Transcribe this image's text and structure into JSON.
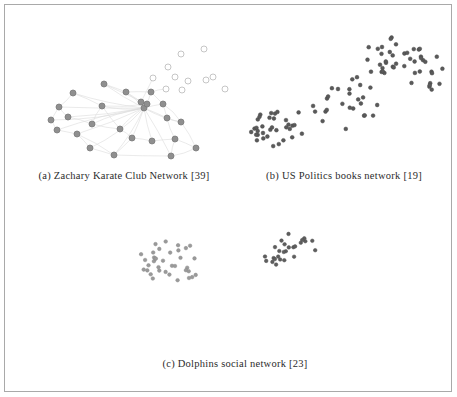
{
  "figure": {
    "border_color": "#a9a9a9",
    "background": "#ffffff"
  },
  "subfigures": [
    {
      "id": "a",
      "caption": "(a) Zachary Karate Club Network [39]",
      "name": "zachary-karate-club-network"
    },
    {
      "id": "b",
      "caption": "(b) US Politics books network [19]",
      "name": "us-politics-books-network"
    },
    {
      "id": "c",
      "caption": "(c) Dolphins social network [23]",
      "name": "dolphins-social-network"
    }
  ],
  "chart_data": [
    {
      "type": "scatter",
      "title": "(a) Zachary Karate Club Network [39]",
      "subfigure": "a",
      "xlabel": "",
      "ylabel": "",
      "grid": false,
      "legend": "none",
      "xlim": [
        0,
        216
      ],
      "ylim": [
        0,
        150
      ],
      "node_styles": {
        "community_1": {
          "fill": "#8f8f8f",
          "stroke": "#7a7a7a",
          "radius": 3.0
        },
        "community_2": {
          "fill": "#ffffff",
          "stroke": "#b8b8b8",
          "radius": 3.0
        }
      },
      "edge_style": {
        "stroke": "#dcdcdc",
        "width": 0.6
      },
      "nodes": [
        {
          "id": 0,
          "x": 128,
          "y": 98,
          "group": "community_1"
        },
        {
          "id": 1,
          "x": 147,
          "y": 94,
          "group": "community_1"
        },
        {
          "id": 2,
          "x": 131,
          "y": 94,
          "group": "community_1"
        },
        {
          "id": 3,
          "x": 125,
          "y": 92,
          "group": "community_1"
        },
        {
          "id": 4,
          "x": 57,
          "y": 83,
          "group": "community_1"
        },
        {
          "id": 5,
          "x": 43,
          "y": 97,
          "group": "community_1"
        },
        {
          "id": 6,
          "x": 35,
          "y": 110,
          "group": "community_1"
        },
        {
          "id": 7,
          "x": 52,
          "y": 107,
          "group": "community_1"
        },
        {
          "id": 8,
          "x": 41,
          "y": 120,
          "group": "community_1"
        },
        {
          "id": 9,
          "x": 61,
          "y": 124,
          "group": "community_1"
        },
        {
          "id": 10,
          "x": 76,
          "y": 114,
          "group": "community_1"
        },
        {
          "id": 11,
          "x": 74,
          "y": 138,
          "group": "community_1"
        },
        {
          "id": 12,
          "x": 98,
          "y": 145,
          "group": "community_1"
        },
        {
          "id": 13,
          "x": 116,
          "y": 128,
          "group": "community_1"
        },
        {
          "id": 14,
          "x": 104,
          "y": 119,
          "group": "community_1"
        },
        {
          "id": 15,
          "x": 136,
          "y": 131,
          "group": "community_1"
        },
        {
          "id": 16,
          "x": 155,
          "y": 146,
          "group": "community_1"
        },
        {
          "id": 17,
          "x": 180,
          "y": 138,
          "group": "community_1"
        },
        {
          "id": 18,
          "x": 165,
          "y": 112,
          "group": "community_1"
        },
        {
          "id": 19,
          "x": 159,
          "y": 129,
          "group": "community_1"
        },
        {
          "id": 20,
          "x": 151,
          "y": 108,
          "group": "community_1"
        },
        {
          "id": 21,
          "x": 110,
          "y": 82,
          "group": "community_1"
        },
        {
          "id": 22,
          "x": 88,
          "y": 74,
          "group": "community_1"
        },
        {
          "id": 23,
          "x": 135,
          "y": 82,
          "group": "community_1"
        },
        {
          "id": 24,
          "x": 86,
          "y": 96,
          "group": "community_1"
        },
        {
          "id": 25,
          "x": 150,
          "y": 79,
          "group": "community_2"
        },
        {
          "id": 26,
          "x": 166,
          "y": 80,
          "group": "community_2"
        },
        {
          "id": 27,
          "x": 137,
          "y": 68,
          "group": "community_2"
        },
        {
          "id": 28,
          "x": 159,
          "y": 67,
          "group": "community_2"
        },
        {
          "id": 29,
          "x": 172,
          "y": 71,
          "group": "community_2"
        },
        {
          "id": 30,
          "x": 190,
          "y": 70,
          "group": "community_2"
        },
        {
          "id": 31,
          "x": 197,
          "y": 67,
          "group": "community_2"
        },
        {
          "id": 32,
          "x": 152,
          "y": 57,
          "group": "community_2"
        },
        {
          "id": 33,
          "x": 165,
          "y": 44,
          "group": "community_2"
        },
        {
          "id": 34,
          "x": 188,
          "y": 39,
          "group": "community_2"
        },
        {
          "id": 35,
          "x": 224,
          "y": 46,
          "group": "community_2"
        },
        {
          "id": 36,
          "x": 240,
          "y": 53,
          "group": "community_2"
        },
        {
          "id": 37,
          "x": 254,
          "y": 37,
          "group": "community_2"
        },
        {
          "id": 38,
          "x": 278,
          "y": 29,
          "group": "community_2"
        },
        {
          "id": 39,
          "x": 247,
          "y": 63,
          "group": "community_2"
        },
        {
          "id": 40,
          "x": 232,
          "y": 72,
          "group": "community_2"
        },
        {
          "id": 41,
          "x": 209,
          "y": 79,
          "group": "community_2"
        }
      ],
      "edges": [
        [
          0,
          1
        ],
        [
          0,
          2
        ],
        [
          0,
          3
        ],
        [
          0,
          4
        ],
        [
          0,
          5
        ],
        [
          0,
          6
        ],
        [
          0,
          7
        ],
        [
          0,
          8
        ],
        [
          0,
          9
        ],
        [
          0,
          10
        ],
        [
          0,
          11
        ],
        [
          0,
          12
        ],
        [
          0,
          13
        ],
        [
          0,
          14
        ],
        [
          0,
          15
        ],
        [
          0,
          16
        ],
        [
          0,
          18
        ],
        [
          0,
          20
        ],
        [
          0,
          21
        ],
        [
          0,
          22
        ],
        [
          0,
          23
        ],
        [
          0,
          24
        ],
        [
          2,
          22
        ],
        [
          2,
          24
        ],
        [
          3,
          21
        ],
        [
          4,
          24
        ],
        [
          5,
          6
        ],
        [
          5,
          7
        ],
        [
          6,
          8
        ],
        [
          7,
          10
        ],
        [
          9,
          11
        ],
        [
          10,
          14
        ],
        [
          11,
          12
        ],
        [
          12,
          13
        ],
        [
          13,
          14
        ],
        [
          13,
          15
        ],
        [
          15,
          19
        ],
        [
          16,
          17
        ],
        [
          16,
          19
        ],
        [
          18,
          20
        ],
        [
          18,
          17
        ],
        [
          19,
          20
        ],
        [
          21,
          23
        ],
        [
          1,
          23
        ],
        [
          1,
          20
        ],
        [
          1,
          18
        ],
        [
          3,
          27
        ],
        [
          23,
          25
        ],
        [
          12,
          16
        ],
        [
          9,
          12
        ],
        [
          8,
          9
        ],
        [
          4,
          5
        ],
        [
          24,
          10
        ],
        [
          22,
          21
        ],
        [
          14,
          24
        ],
        [
          17,
          19
        ]
      ]
    },
    {
      "type": "scatter",
      "title": "(b) US Politics books network [19]",
      "subfigure": "b",
      "xlabel": "",
      "ylabel": "",
      "grid": false,
      "legend": "none",
      "xlim": [
        0,
        212
      ],
      "ylim": [
        0,
        150
      ],
      "node_styles": {
        "default": {
          "fill": "#5a5a5a",
          "stroke": "#4a4a4a",
          "radius": 1.9
        }
      },
      "edge_style": {
        "stroke": "#c9c9c9",
        "width": 0.45
      },
      "node_count": 105,
      "cluster_seeds": [
        {
          "cx": 42,
          "cy": 118,
          "n": 34,
          "spread": 24
        },
        {
          "cx": 108,
          "cy": 92,
          "n": 26,
          "spread": 32
        },
        {
          "cx": 158,
          "cy": 48,
          "n": 33,
          "spread": 26
        },
        {
          "cx": 188,
          "cy": 62,
          "n": 12,
          "spread": 22
        }
      ]
    },
    {
      "type": "scatter",
      "title": "(c) Dolphins social network [23]",
      "subfigure": "c",
      "xlabel": "",
      "ylabel": "",
      "grid": false,
      "legend": "none",
      "xlim": [
        0,
        240
      ],
      "ylim": [
        0,
        100
      ],
      "node_styles": {
        "community_left": {
          "fill": "#9a9a9a",
          "stroke": "#8a8a8a",
          "radius": 1.8
        },
        "community_right": {
          "fill": "#5e5e5e",
          "stroke": "#4e4e4e",
          "radius": 1.8
        }
      },
      "edge_style": {
        "stroke": "#d2d2d2",
        "width": 0.45
      },
      "node_count": 62,
      "cluster_seeds": [
        {
          "cx": 52,
          "cy": 56,
          "n": 36,
          "spread": 26,
          "group": "community_left"
        },
        {
          "cx": 168,
          "cy": 42,
          "n": 26,
          "spread": 24,
          "group": "community_right"
        }
      ]
    }
  ]
}
